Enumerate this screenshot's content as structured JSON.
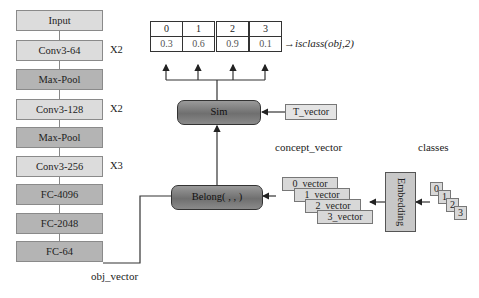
{
  "network": {
    "layers": [
      {
        "label": "Input",
        "shade": "light"
      },
      {
        "label": "Conv3-64",
        "shade": "light",
        "repeat": "X2"
      },
      {
        "label": "Max-Pool",
        "shade": "dark"
      },
      {
        "label": "Conv3-128",
        "shade": "light",
        "repeat": "X2"
      },
      {
        "label": "Max-Pool",
        "shade": "dark"
      },
      {
        "label": "Conv3-256",
        "shade": "light",
        "repeat": "X3"
      },
      {
        "label": "FC-4096",
        "shade": "dark"
      },
      {
        "label": "FC-2048",
        "shade": "dark"
      },
      {
        "label": "FC-64",
        "shade": "dark"
      }
    ],
    "output_label": "obj_vector"
  },
  "result_table": {
    "headers": [
      "0",
      "1",
      "2",
      "3"
    ],
    "values": [
      "0.3",
      "0.6",
      "0.9",
      "0.1"
    ],
    "annotation": "→isclass(obj,2)"
  },
  "sim_block": {
    "label": "Sim",
    "input": "T_vector"
  },
  "belong_block": {
    "label": "Belong( , , )"
  },
  "concept": {
    "title": "concept_vector",
    "vectors": [
      "0_vector",
      "1_vector",
      "2_vector",
      "3_vector"
    ]
  },
  "embedding": {
    "label": "Embedding"
  },
  "classes": {
    "title": "classes",
    "items": [
      "0",
      "1",
      "2",
      "3"
    ]
  },
  "colors": {
    "light_box": "#dcdcdc",
    "dark_box": "#b4b4b4",
    "block_fill": "#7f7f7f",
    "line": "#333333"
  }
}
